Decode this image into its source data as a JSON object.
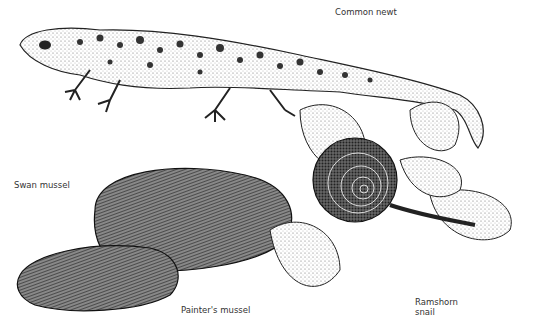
{
  "labels": {
    "common_newt": "Common newt",
    "swan_mussel": "Swan mussel",
    "painters_mussel": "Painter's mussel",
    "ramshorn_snail": "Ramshorn\nsnail"
  }
}
